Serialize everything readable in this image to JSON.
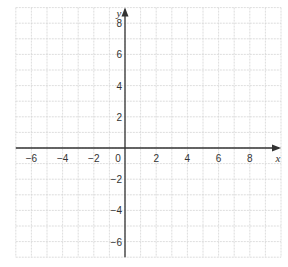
{
  "chart_data": {
    "type": "coordinate-grid",
    "title": "",
    "xlabel": "x",
    "ylabel": "y",
    "xlim": [
      -7,
      10
    ],
    "ylim": [
      -7,
      9
    ],
    "grid": true,
    "grid_step": 1,
    "x_ticks": [
      -6,
      -4,
      -2,
      0,
      2,
      4,
      6,
      8
    ],
    "y_ticks": [
      -6,
      -4,
      -2,
      2,
      4,
      6,
      8
    ],
    "origin_label": "0",
    "series": []
  },
  "colors": {
    "grid": "#d4d4d4",
    "axis": "#333333",
    "background": "#ffffff"
  },
  "layout": {
    "unit_px": 15.6,
    "origin_px": [
      125,
      148
    ]
  }
}
